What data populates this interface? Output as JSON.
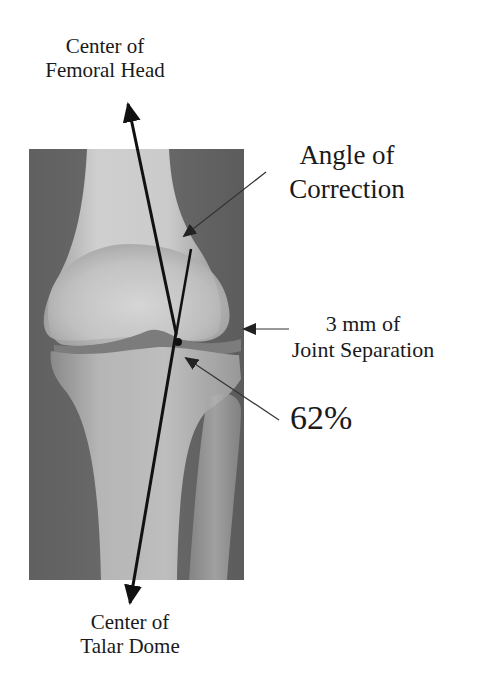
{
  "figure": {
    "type": "annotated knee radiograph",
    "image": {
      "description": "Anteroposterior X-ray of knee joint (distal femur, tibia, fibula)",
      "background_color": "#ffffff",
      "xray_tone_dark": "#5a5a5a",
      "xray_tone_light": "#d8d8d8"
    },
    "labels": {
      "femoral_head": {
        "line1": "Center of",
        "line2": "Femoral Head"
      },
      "talar_dome": {
        "line1": "Center of",
        "line2": "Talar Dome"
      },
      "angle": {
        "line1": "Angle of",
        "line2": "Correction"
      },
      "joint": {
        "line1": "3 mm of",
        "line2": "Joint Separation"
      },
      "percent": "62%"
    },
    "annotations": {
      "mechanical_axis": "Line from center of femoral head to center of talar dome",
      "correction_line": "Short line indicating angle of correction",
      "intersection_point": "Dot marking 62% across tibial plateau",
      "line_color": "#111111",
      "pointer_color": "#3a3a3a"
    }
  }
}
